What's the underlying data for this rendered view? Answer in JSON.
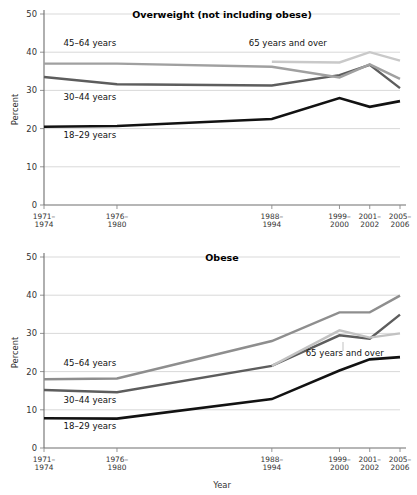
{
  "figure": {
    "xlabel": "Year",
    "ylabel": "Percent"
  },
  "chart_data": [
    {
      "type": "line",
      "title": "Overweight (not including obese)",
      "xlabel": "",
      "ylabel": "Percent",
      "categories": [
        "1971–1974",
        "1976–1980",
        "1988–1994",
        "1999–2000",
        "2001–2002",
        "2005–2006"
      ],
      "x_positions": [
        0.0,
        0.205,
        0.64,
        0.83,
        0.915,
        1.0
      ],
      "ylim": [
        0,
        50
      ],
      "yticks": [
        0,
        10,
        20,
        30,
        40,
        50
      ],
      "grid": true,
      "legend_position": "inline-annotations",
      "series": [
        {
          "name": "18–29 years",
          "color": "#121212",
          "width": 2.6,
          "values": [
            20.5,
            20.7,
            22.5,
            28.0,
            25.7,
            27.2
          ]
        },
        {
          "name": "30–44 years",
          "color": "#5d5d5d",
          "width": 2.4,
          "values": [
            33.5,
            31.6,
            31.3,
            34.0,
            36.7,
            30.6
          ]
        },
        {
          "name": "45–64 years",
          "color": "#a0a0a0",
          "width": 2.4,
          "values": [
            37.0,
            37.0,
            36.2,
            33.4,
            36.8,
            33.0
          ]
        },
        {
          "name": "65 years and over",
          "color": "#c9c9c9",
          "width": 2.4,
          "values": [
            null,
            null,
            37.5,
            37.3,
            40.0,
            37.8
          ]
        }
      ],
      "annotations": [
        {
          "text": "45–64 years",
          "x": 0.055,
          "y": 41.6
        },
        {
          "text": "30–44 years",
          "x": 0.055,
          "y": 27.6
        },
        {
          "text": "18–29 years",
          "x": 0.055,
          "y": 17.5
        },
        {
          "text": "65 years and over",
          "x": 0.575,
          "y": 41.6
        }
      ]
    },
    {
      "type": "line",
      "title": "Obese",
      "xlabel": "Year",
      "ylabel": "Percent",
      "categories": [
        "1971–1974",
        "1976–1980",
        "1988–1994",
        "1999–2000",
        "2001–2002",
        "2005–2006"
      ],
      "x_positions": [
        0.0,
        0.205,
        0.64,
        0.83,
        0.915,
        1.0
      ],
      "ylim": [
        0,
        50
      ],
      "yticks": [
        0,
        10,
        20,
        30,
        40,
        50
      ],
      "grid": true,
      "legend_position": "inline-annotations",
      "series": [
        {
          "name": "18–29 years",
          "color": "#121212",
          "width": 2.6,
          "values": [
            7.8,
            7.7,
            12.8,
            20.3,
            23.2,
            23.8
          ]
        },
        {
          "name": "30–44 years",
          "color": "#5d5d5d",
          "width": 2.4,
          "values": [
            15.2,
            14.6,
            21.5,
            29.5,
            28.6,
            34.9
          ]
        },
        {
          "name": "45–64 years",
          "color": "#8e8e8e",
          "width": 2.4,
          "values": [
            18.0,
            18.2,
            28.0,
            35.5,
            35.5,
            39.9
          ]
        },
        {
          "name": "65 years and over",
          "color": "#c2c2c2",
          "width": 2.4,
          "values": [
            null,
            null,
            21.5,
            30.8,
            28.9,
            30.0
          ]
        }
      ],
      "annotations": [
        {
          "text": "45–64 years",
          "x": 0.055,
          "y": 21.5
        },
        {
          "text": "30–44 years",
          "x": 0.055,
          "y": 11.8
        },
        {
          "text": "18–29 years",
          "x": 0.055,
          "y": 4.9
        },
        {
          "text": "65 years and over",
          "x": 0.735,
          "y": 24.2
        }
      ]
    }
  ]
}
